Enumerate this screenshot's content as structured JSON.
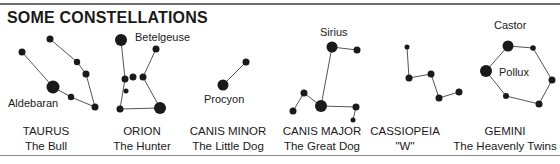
{
  "title": "SOME CONSTELLATIONS",
  "constellations": [
    {
      "name": "TAURUS",
      "subtitle": "The Bull",
      "center_x": 46,
      "stars": [
        [
          22,
          52,
          3.5
        ],
        [
          50,
          39,
          3.5
        ],
        [
          77,
          62,
          3.2
        ],
        [
          86,
          74,
          3.5
        ],
        [
          53,
          87,
          6.5
        ],
        [
          71,
          97,
          3.2
        ],
        [
          95,
          107,
          3.5
        ]
      ],
      "lines": [
        [
          0,
          4
        ],
        [
          4,
          5
        ],
        [
          5,
          6
        ],
        [
          1,
          2
        ],
        [
          2,
          3
        ],
        [
          3,
          6
        ]
      ],
      "labels": [
        {
          "text": "Aldebaran",
          "x": 8,
          "y": 97
        }
      ]
    },
    {
      "name": "ORION",
      "subtitle": "The Hunter",
      "center_x": 142,
      "stars": [
        [
          121,
          40,
          6
        ],
        [
          156,
          49,
          3.5
        ],
        [
          125,
          79,
          3.5
        ],
        [
          133,
          77,
          3.5
        ],
        [
          143,
          77,
          3.5
        ],
        [
          126,
          91,
          2.5
        ],
        [
          120,
          109,
          3.5
        ],
        [
          160,
          108,
          6
        ]
      ],
      "lines": [
        [
          0,
          2
        ],
        [
          2,
          6
        ],
        [
          6,
          7
        ],
        [
          7,
          4
        ],
        [
          4,
          1
        ]
      ],
      "labels": [
        {
          "text": "Betelgeuse",
          "x": 135,
          "y": 31
        }
      ]
    },
    {
      "name": "CANIS MINOR",
      "subtitle": "The Little Dog",
      "center_x": 228,
      "stars": [
        [
          223,
          85,
          5.5
        ],
        [
          246,
          62,
          3.5
        ]
      ],
      "lines": [
        [
          0,
          1
        ]
      ],
      "labels": [
        {
          "text": "Procyon",
          "x": 204,
          "y": 93
        }
      ]
    },
    {
      "name": "CANIS MAJOR",
      "subtitle": "The Great Dog",
      "center_x": 322,
      "stars": [
        [
          332,
          47,
          5.5
        ],
        [
          357,
          50,
          3.5
        ],
        [
          304,
          93,
          3.5
        ],
        [
          293,
          111,
          3.5
        ],
        [
          321,
          106,
          6
        ],
        [
          356,
          107,
          3.5
        ],
        [
          353,
          120,
          2.5
        ]
      ],
      "lines": [
        [
          0,
          1
        ],
        [
          0,
          4
        ],
        [
          4,
          2
        ],
        [
          2,
          3
        ],
        [
          4,
          5
        ],
        [
          5,
          6
        ]
      ],
      "labels": [
        {
          "text": "Sirius",
          "x": 320,
          "y": 26
        }
      ]
    },
    {
      "name": "CASSIOPEIA",
      "subtitle": "\"W\"",
      "center_x": 405,
      "stars": [
        [
          407,
          47,
          2.5
        ],
        [
          409,
          78,
          3.5
        ],
        [
          431,
          74,
          3.5
        ],
        [
          439,
          98,
          3.5
        ],
        [
          459,
          92,
          3.5
        ]
      ],
      "lines": [
        [
          0,
          1
        ],
        [
          1,
          2
        ],
        [
          2,
          3
        ],
        [
          3,
          4
        ]
      ],
      "labels": []
    },
    {
      "name": "GEMINI",
      "subtitle": "The Heavenly Twins",
      "center_x": 505,
      "stars": [
        [
          508,
          46,
          5.5
        ],
        [
          533,
          48,
          2.8
        ],
        [
          486,
          71,
          6
        ],
        [
          552,
          80,
          3.5
        ],
        [
          506,
          96,
          3
        ],
        [
          539,
          104,
          3.5
        ]
      ],
      "lines": [
        [
          0,
          1
        ],
        [
          1,
          3
        ],
        [
          3,
          5
        ],
        [
          5,
          4
        ],
        [
          4,
          2
        ],
        [
          2,
          0
        ]
      ],
      "labels": [
        {
          "text": "Castor",
          "x": 494,
          "y": 19
        },
        {
          "text": "Pollux",
          "x": 499,
          "y": 66
        }
      ]
    }
  ],
  "colors": {
    "star": "#1a1a1a",
    "line": "#555555",
    "text": "#1a1a1a",
    "rule": "#6e6e6e"
  }
}
